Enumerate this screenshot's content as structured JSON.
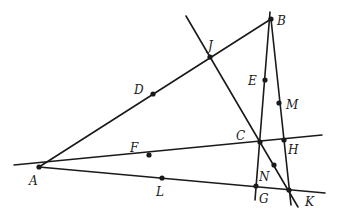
{
  "diagram": {
    "type": "geometry-figure",
    "stroke_color": "#1a1a1a",
    "background": "#ffffff",
    "points": {
      "A": {
        "label": "A",
        "x": 39,
        "y": 167
      },
      "B": {
        "label": "B",
        "x": 271,
        "y": 19
      },
      "C": {
        "label": "C",
        "x": 260,
        "y": 142
      },
      "D": {
        "label": "D",
        "x": 153,
        "y": 94
      },
      "E": {
        "label": "E",
        "x": 265,
        "y": 80
      },
      "F": {
        "label": "F",
        "x": 149,
        "y": 155
      },
      "G": {
        "label": "G",
        "x": 256,
        "y": 186
      },
      "H": {
        "label": "H",
        "x": 284,
        "y": 140
      },
      "J": {
        "label": "J",
        "x": 210,
        "y": 57
      },
      "K": {
        "label": "K",
        "x": 289,
        "y": 190
      },
      "L": {
        "label": "L",
        "x": 162,
        "y": 178
      },
      "M": {
        "label": "M",
        "x": 279,
        "y": 103
      },
      "N": {
        "label": "N",
        "x": 274,
        "y": 165
      }
    },
    "lines": [
      {
        "name": "line-AB",
        "through": [
          "A",
          "D",
          "J",
          "B"
        ]
      },
      {
        "name": "line-AH",
        "through": [
          "A",
          "F",
          "C",
          "H"
        ]
      },
      {
        "name": "line-AK",
        "through": [
          "A",
          "L",
          "G",
          "K"
        ]
      },
      {
        "name": "line-BG",
        "through": [
          "B",
          "E",
          "C",
          "G"
        ]
      },
      {
        "name": "line-BK",
        "through": [
          "B",
          "M",
          "H",
          "K"
        ]
      },
      {
        "name": "line-JK",
        "through": [
          "J",
          "C",
          "N",
          "K"
        ]
      }
    ]
  }
}
